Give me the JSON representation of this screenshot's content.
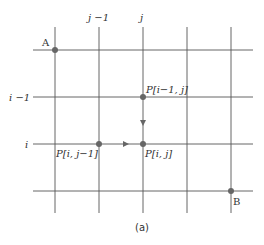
{
  "diagram": {
    "caption": "(a)",
    "column_labels": {
      "j_minus_1": "j −1",
      "j": "j"
    },
    "row_labels": {
      "i_minus_1": "i −1",
      "i": "i"
    },
    "points": {
      "A": "A",
      "B": "B",
      "p_im1_j": "P[i−1, j]",
      "p_i_jm1": "P[i, j−1]",
      "p_i_j": "P[i, j]"
    },
    "colors": {
      "line": "#555555",
      "point": "#666666"
    }
  }
}
